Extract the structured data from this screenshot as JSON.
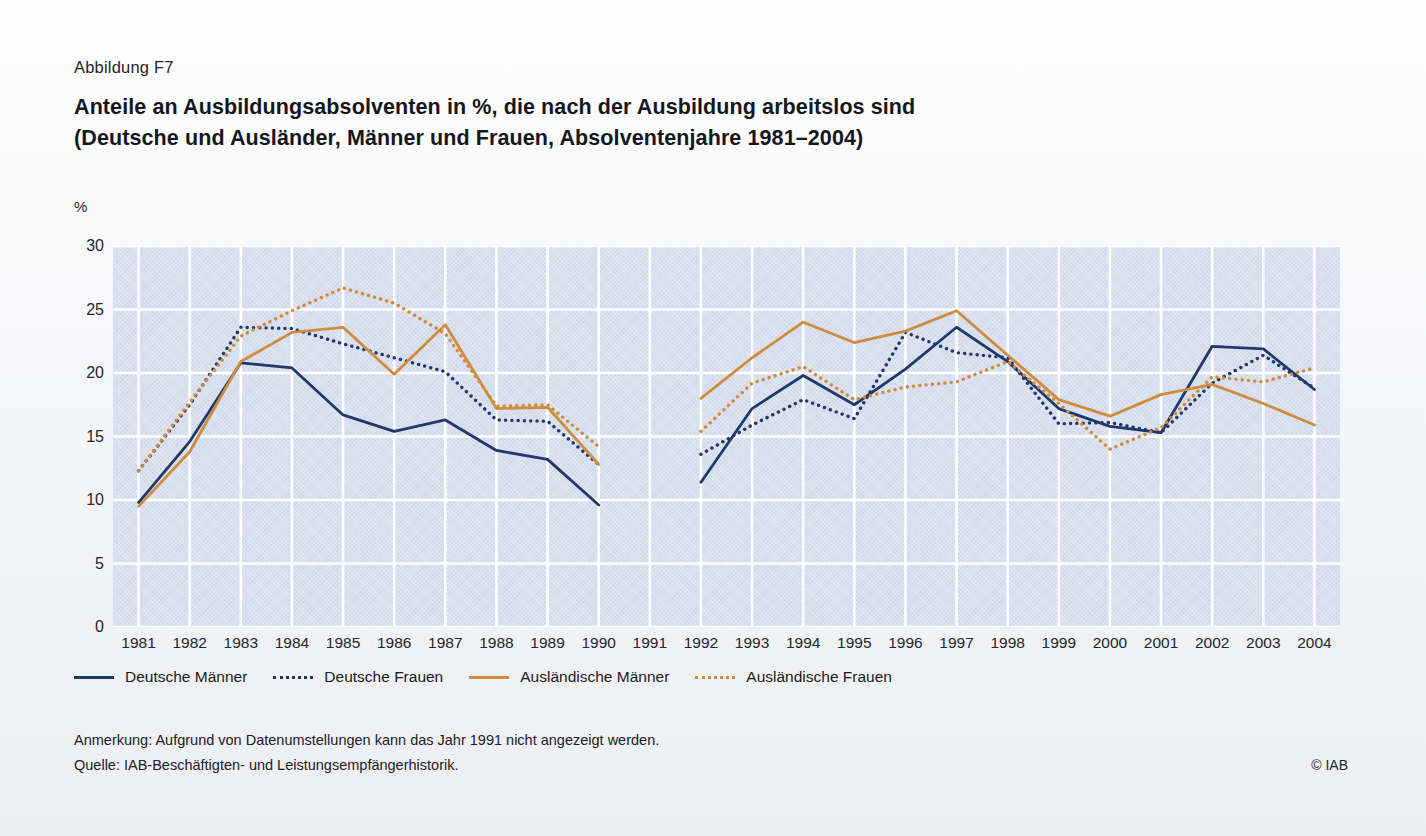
{
  "figure_number": "Abbildung F7",
  "title_line1": "Anteile an Ausbildungsabsolventen in %, die nach der Ausbildung arbeitslos sind",
  "title_line2": "(Deutsche und Ausländer, Männer und Frauen, Absolventenjahre 1981–2004)",
  "y_axis_unit": "%",
  "footer": {
    "note": "Anmerkung: Aufgrund von Datenumstellungen kann das Jahr 1991 nicht angezeigt werden.",
    "source": "Quelle: IAB-Beschäftigten- und Leistungsempfängerhistorik.",
    "copyright": "© IAB"
  },
  "colors": {
    "german_men": "#21386b",
    "german_women": "#21386b",
    "foreign_men": "#cf8c3c",
    "foreign_women": "#cf8c3c",
    "plot_background": "#d8dfee",
    "gridline": "#ffffff",
    "page_background": "#f4f5f7"
  },
  "legend": [
    {
      "label": "Deutsche Männer",
      "color": "#21386b",
      "style": "solid"
    },
    {
      "label": "Deutsche Frauen",
      "color": "#21386b",
      "style": "dotted"
    },
    {
      "label": "Ausländische Männer",
      "color": "#cf8c3c",
      "style": "solid"
    },
    {
      "label": "Ausländische Frauen",
      "color": "#cf8c3c",
      "style": "dotted"
    }
  ],
  "chart_data": {
    "type": "line",
    "title": "Anteile an Ausbildungsabsolventen in %, die nach der Ausbildung arbeitslos sind (Deutsche und Ausländer, Männer und Frauen, Absolventenjahre 1981–2004)",
    "xlabel": "",
    "ylabel": "%",
    "ylim": [
      0,
      30
    ],
    "yticks": [
      0,
      5,
      10,
      15,
      20,
      25,
      30
    ],
    "xlim": [
      "1981",
      "2004"
    ],
    "categories": [
      "1981",
      "1982",
      "1983",
      "1984",
      "1985",
      "1986",
      "1987",
      "1988",
      "1989",
      "1990",
      "1991",
      "1992",
      "1993",
      "1994",
      "1995",
      "1996",
      "1997",
      "1998",
      "1999",
      "2000",
      "2001",
      "2002",
      "2003",
      "2004"
    ],
    "grid": true,
    "legend_position": "below-axes",
    "gap_note": "Jahr 1991 nicht angezeigt (Datenumstellung) – Lücke in allen Reihen",
    "series": [
      {
        "name": "Deutsche Männer",
        "color": "#21386b",
        "style": "solid",
        "values": [
          9.8,
          14.6,
          20.8,
          20.4,
          16.7,
          15.4,
          16.3,
          13.9,
          13.2,
          9.6,
          null,
          11.4,
          17.2,
          19.8,
          17.5,
          20.3,
          23.6,
          20.9,
          17.2,
          15.8,
          15.3,
          22.1,
          21.9,
          18.7
        ]
      },
      {
        "name": "Deutsche Frauen",
        "color": "#21386b",
        "style": "dotted",
        "values": [
          12.3,
          17.5,
          23.6,
          23.5,
          22.3,
          21.2,
          20.1,
          16.3,
          16.2,
          12.8,
          null,
          13.6,
          15.9,
          17.9,
          16.4,
          23.2,
          21.6,
          21.2,
          16.0,
          16.1,
          15.3,
          19.2,
          21.4,
          18.8
        ]
      },
      {
        "name": "Ausländische Männer",
        "color": "#cf8c3c",
        "style": "solid",
        "values": [
          9.5,
          13.8,
          20.9,
          23.2,
          23.6,
          19.9,
          23.8,
          17.2,
          17.3,
          12.8,
          null,
          18.0,
          21.2,
          24.0,
          22.4,
          23.3,
          24.9,
          21.4,
          17.9,
          16.6,
          18.3,
          19.1,
          17.6,
          15.9
        ]
      },
      {
        "name": "Ausländische Frauen",
        "color": "#cf8c3c",
        "style": "dotted",
        "values": [
          12.3,
          17.7,
          22.9,
          24.9,
          26.7,
          25.5,
          23.1,
          17.4,
          17.5,
          14.2,
          null,
          15.4,
          19.2,
          20.5,
          17.9,
          18.9,
          19.3,
          20.9,
          17.6,
          14.0,
          15.7,
          19.7,
          19.3,
          20.4
        ]
      }
    ]
  }
}
